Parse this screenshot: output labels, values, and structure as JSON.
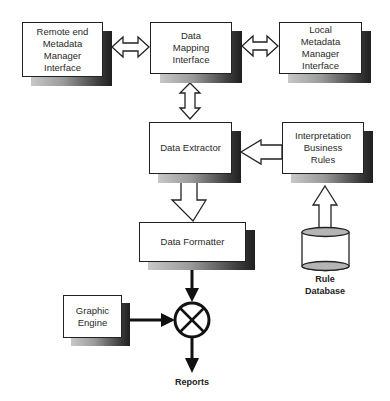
{
  "diagram": {
    "nodes": {
      "remote": {
        "label": "Remote end Metadata Manager Interface"
      },
      "mapping": {
        "label": "Data Mapping Interface"
      },
      "local": {
        "label": "Local Metadata Manager Interface"
      },
      "extractor": {
        "label": "Data Extractor"
      },
      "rules": {
        "label": "Interpretation Business Rules"
      },
      "formatter": {
        "label": "Data Formatter"
      },
      "graphic": {
        "label": "Graphic Engine"
      },
      "rule_db": {
        "label_line1": "Rule",
        "label_line2": "Database"
      },
      "reports": {
        "label": "Reports"
      }
    },
    "edges": [
      {
        "from": "remote",
        "to": "mapping",
        "type": "bidirectional-hollow"
      },
      {
        "from": "mapping",
        "to": "local",
        "type": "bidirectional-hollow"
      },
      {
        "from": "mapping",
        "to": "extractor",
        "type": "bidirectional-hollow"
      },
      {
        "from": "rules",
        "to": "extractor",
        "type": "hollow-arrow"
      },
      {
        "from": "rule_db",
        "to": "rules",
        "type": "hollow-arrow"
      },
      {
        "from": "extractor",
        "to": "formatter",
        "type": "hollow-arrow"
      },
      {
        "from": "formatter",
        "to": "combiner",
        "type": "solid-arrow"
      },
      {
        "from": "graphic",
        "to": "combiner",
        "type": "solid-arrow"
      },
      {
        "from": "combiner",
        "to": "reports",
        "type": "solid-arrow"
      }
    ],
    "colors": {
      "line": "#222222",
      "shadow_dark": "#1f1f1f",
      "shadow_light": "#c8c8c8",
      "cylinder_fill": "#b5b5b5"
    }
  }
}
